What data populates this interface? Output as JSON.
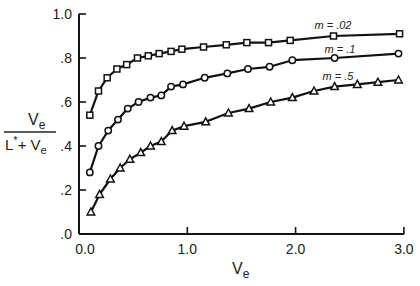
{
  "chart_data": {
    "type": "line",
    "title": "",
    "xlabel": "V_e",
    "ylabel": "V_e / (L* + V_e)",
    "xlim": [
      0,
      3.0
    ],
    "ylim": [
      0,
      1.0
    ],
    "x_ticks": [
      0.0,
      1.0,
      2.0,
      3.0
    ],
    "x_tick_labels": [
      "0.0",
      "1.0",
      "2.0",
      "3.0"
    ],
    "y_ticks": [
      0.0,
      0.2,
      0.4,
      0.6,
      0.8,
      1.0
    ],
    "y_tick_labels": [
      ".0",
      ".2",
      ".4",
      ".6",
      ".8",
      "1.0"
    ],
    "grid": false,
    "legend": "inline labels near right end of each curve",
    "series": [
      {
        "name": "m = .02",
        "marker": "square",
        "x": [
          0.1,
          0.18,
          0.26,
          0.35,
          0.44,
          0.54,
          0.64,
          0.74,
          0.85,
          0.95,
          1.15,
          1.36,
          1.55,
          1.75,
          1.95,
          2.35,
          2.96
        ],
        "y": [
          0.54,
          0.65,
          0.71,
          0.75,
          0.77,
          0.8,
          0.81,
          0.82,
          0.83,
          0.84,
          0.85,
          0.86,
          0.87,
          0.87,
          0.88,
          0.9,
          0.91
        ]
      },
      {
        "name": "m = .1",
        "marker": "circle",
        "x": [
          0.1,
          0.18,
          0.27,
          0.36,
          0.45,
          0.55,
          0.66,
          0.76,
          0.85,
          0.96,
          1.16,
          1.37,
          1.56,
          1.76,
          1.97,
          2.36,
          2.95
        ],
        "y": [
          0.28,
          0.4,
          0.47,
          0.52,
          0.57,
          0.6,
          0.62,
          0.63,
          0.67,
          0.68,
          0.71,
          0.73,
          0.75,
          0.76,
          0.79,
          0.8,
          0.82
        ]
      },
      {
        "name": "m = .5",
        "marker": "triangle",
        "x": [
          0.11,
          0.19,
          0.29,
          0.38,
          0.47,
          0.57,
          0.66,
          0.76,
          0.86,
          0.97,
          1.17,
          1.38,
          1.57,
          1.77,
          1.97,
          2.17,
          2.36,
          2.57,
          2.76,
          2.95
        ],
        "y": [
          0.1,
          0.18,
          0.25,
          0.3,
          0.34,
          0.37,
          0.4,
          0.42,
          0.47,
          0.49,
          0.51,
          0.55,
          0.57,
          0.6,
          0.62,
          0.65,
          0.67,
          0.68,
          0.69,
          0.7
        ]
      }
    ]
  },
  "labels": {
    "y_num": "V",
    "y_num_sub": "e",
    "y_den": "L",
    "y_den_star": "*",
    "y_den_plus": "+ V",
    "y_den_sub": "e",
    "x_main": "V",
    "x_sub": "e"
  }
}
